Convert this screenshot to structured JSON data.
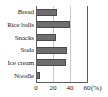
{
  "chart_data": {
    "type": "bar",
    "orientation": "horizontal",
    "title": "",
    "subtitle": "",
    "xlabel": "(%)",
    "ylabel": "",
    "categories": [
      "Bread",
      "Rice balls",
      "Snacks",
      "Soda",
      "Ice cream",
      "Noodle"
    ],
    "values": [
      25,
      40,
      24,
      36,
      35,
      5
    ],
    "series": [
      {
        "name": "",
        "values": [
          25,
          40,
          24,
          36,
          35,
          5
        ]
      }
    ],
    "xlim": [
      0,
      60
    ],
    "xticks": [
      0,
      20,
      40,
      60
    ],
    "xtick_labels": [
      "0",
      "20",
      "40",
      "60"
    ],
    "unit_label": "(%)",
    "grid": true,
    "grid_axis": "x",
    "legend": false,
    "legend_position": "none",
    "bar_color": "#6e6e6e",
    "bar_edge_color": "#4a4a4a",
    "grid_color": "#c9c9c9",
    "axis_color": "#5a5a5a",
    "background_color": "#ffffff",
    "text_color": "#1a1a1a"
  }
}
